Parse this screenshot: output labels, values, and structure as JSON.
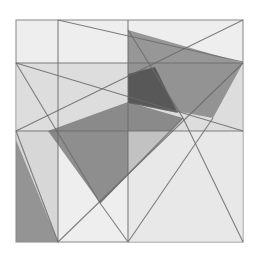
{
  "artwork": {
    "description": "Abstract geometric composition of overlapping translucent gray polygons and crossing lines within a square frame",
    "background": "#ffffff",
    "frame": {
      "x": 16,
      "y": 20,
      "width": 227,
      "height": 222,
      "fill": "#eeeeee",
      "stroke": "#9a9a9a"
    },
    "polygons": [
      {
        "name": "top-band",
        "points": "16,63 243,63 243,131 16,131",
        "fill": "#cfcfcf",
        "opacity": 0.55
      },
      {
        "name": "left-lower-wedge",
        "points": "16,131 58,131 58,242 16,242",
        "fill": "#c8c8c8",
        "opacity": 0.6
      },
      {
        "name": "left-dark-triangle",
        "points": "16,140 16,242 58,242",
        "fill": "#7d7d7d",
        "opacity": 0.75
      },
      {
        "name": "large-gray-quad",
        "points": "128,30 243,63 213,118 128,102",
        "fill": "#7a7a7a",
        "opacity": 0.75
      },
      {
        "name": "large-gray-lower",
        "points": "48,131 128,102 183,118 100,203",
        "fill": "#6e6e6e",
        "opacity": 0.75
      },
      {
        "name": "dark-overlap",
        "points": "128,74 155,67 178,113 128,103",
        "fill": "#4a4a4a",
        "opacity": 0.8
      },
      {
        "name": "lower-right-light",
        "points": "128,131 243,131 243,242 128,242",
        "fill": "#e4e4e4",
        "opacity": 0.6
      }
    ],
    "lines": [
      {
        "x1": 58,
        "y1": 20,
        "x2": 58,
        "y2": 242
      },
      {
        "x1": 128,
        "y1": 20,
        "x2": 128,
        "y2": 242
      },
      {
        "x1": 16,
        "y1": 63,
        "x2": 243,
        "y2": 63
      },
      {
        "x1": 16,
        "y1": 131,
        "x2": 243,
        "y2": 131
      },
      {
        "x1": 58,
        "y1": 20,
        "x2": 243,
        "y2": 62
      },
      {
        "x1": 16,
        "y1": 131,
        "x2": 243,
        "y2": 20
      },
      {
        "x1": 16,
        "y1": 63,
        "x2": 243,
        "y2": 131
      },
      {
        "x1": 16,
        "y1": 131,
        "x2": 58,
        "y2": 242
      },
      {
        "x1": 16,
        "y1": 63,
        "x2": 100,
        "y2": 203
      },
      {
        "x1": 100,
        "y1": 203,
        "x2": 183,
        "y2": 118
      },
      {
        "x1": 58,
        "y1": 242,
        "x2": 243,
        "y2": 63
      },
      {
        "x1": 128,
        "y1": 242,
        "x2": 213,
        "y2": 118
      },
      {
        "x1": 183,
        "y1": 118,
        "x2": 243,
        "y2": 242
      },
      {
        "x1": 100,
        "y1": 203,
        "x2": 128,
        "y2": 242
      },
      {
        "x1": 128,
        "y1": 30,
        "x2": 183,
        "y2": 118
      }
    ],
    "line_color": "#6a6a6a"
  }
}
